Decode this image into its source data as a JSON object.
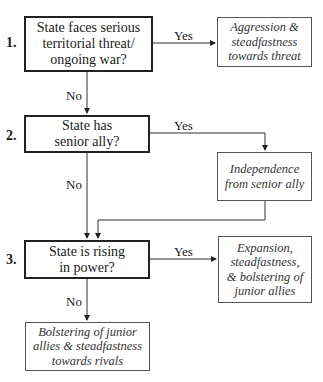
{
  "questions": [
    {
      "number": "1.",
      "text": "State faces serious territorial threat/ ongoing war?"
    },
    {
      "number": "2.",
      "text": "State has senior ally?"
    },
    {
      "number": "3.",
      "text": "State is rising in power?"
    }
  ],
  "outcomes": [
    {
      "text": "Aggression & steadfastness towards threat"
    },
    {
      "text": "Independence from senior ally"
    },
    {
      "text": "Expansion, steadfastness, & bolstering of junior allies"
    },
    {
      "text": "Bolstering of junior allies & steadfastness towards rivals"
    }
  ],
  "edge_labels": {
    "q1_yes": "Yes",
    "q1_no": "No",
    "q2_yes": "Yes",
    "q2_no": "No",
    "q3_yes": "Yes",
    "q3_no": "No"
  }
}
